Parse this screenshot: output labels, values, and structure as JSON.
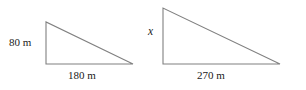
{
  "figure": {
    "background_color": "#ffffff",
    "stroke_color": "#808080",
    "text_color": "#1a1a1a",
    "width": 306,
    "height": 90
  },
  "shapes": [
    {
      "name": "left-triangle",
      "type": "right-triangle",
      "points": "46,22 46,64 133,64",
      "vertical_leg_label": "80 m",
      "horizontal_leg_label": "180 m"
    },
    {
      "name": "right-triangle",
      "type": "right-triangle",
      "points": "163,8 163,64 280,64",
      "vertical_leg_label": "x",
      "horizontal_leg_label": "270 m"
    }
  ],
  "labels": {
    "left_height": "80 m",
    "left_base": "180 m",
    "right_height": "x",
    "right_base": "270 m"
  }
}
